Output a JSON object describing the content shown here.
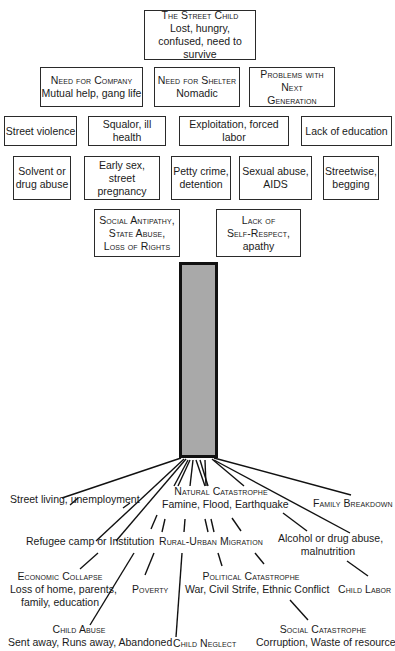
{
  "canopy": {
    "root": {
      "title": "The Street Child",
      "text": "Lost, hungry, confused, need to survive"
    },
    "row2": [
      {
        "title": "Need for Company",
        "text": "Mutual help, gang life"
      },
      {
        "title": "Need for Shelter",
        "text": "Nomadic"
      },
      {
        "title": "Problems with Next Generation",
        "text": ""
      }
    ],
    "row3": [
      "Street violence",
      "Squalor, ill health",
      "Exploitation, forced labor",
      "Lack of education"
    ],
    "row4": [
      {
        "line1": "Solvent or",
        "line2": "drug abuse"
      },
      {
        "line1": "Early sex,",
        "line2": "street pregnancy"
      },
      {
        "line1": "Petty crime,",
        "line2": "detention"
      },
      {
        "line1": "Sexual abuse,",
        "line2": "AIDS"
      },
      {
        "line1": "Streetwise,",
        "line2": "begging"
      }
    ],
    "row5": [
      {
        "line1": "Social Antipathy,",
        "line2": "State Abuse,",
        "line3": "Loss of Rights"
      },
      {
        "line1": "Lack of",
        "line2": "Self-Respect,",
        "line3": "apathy"
      }
    ]
  },
  "roots": {
    "street_living": "Street living, unemployment",
    "natural_catastrophe": {
      "title": "Natural Catastrophe",
      "text": "Famine, Flood, Earthquake"
    },
    "family_breakdown": "Family Breakdown",
    "refugee": "Refugee camp or Institution",
    "rural_urban": "Rural-Urban Migration",
    "alcohol": {
      "line1": "Alcohol or drug abuse,",
      "line2": "malnutrition"
    },
    "economic_collapse": {
      "title": "Economic Collapse",
      "line1": "Loss of home, parents,",
      "line2": "family, education"
    },
    "poverty": "Poverty",
    "political_catastrophe": {
      "title": "Political Catastrophe",
      "text": "War, Civil Strife, Ethnic Conflict"
    },
    "child_labor": "Child Labor",
    "child_abuse": {
      "title": "Child Abuse",
      "text": "Sent away, Runs away, Abandoned"
    },
    "child_neglect": "Child Neglect",
    "social_catastrophe": {
      "title": "Social Catastrophe",
      "text": "Corruption, Waste of resources"
    }
  }
}
